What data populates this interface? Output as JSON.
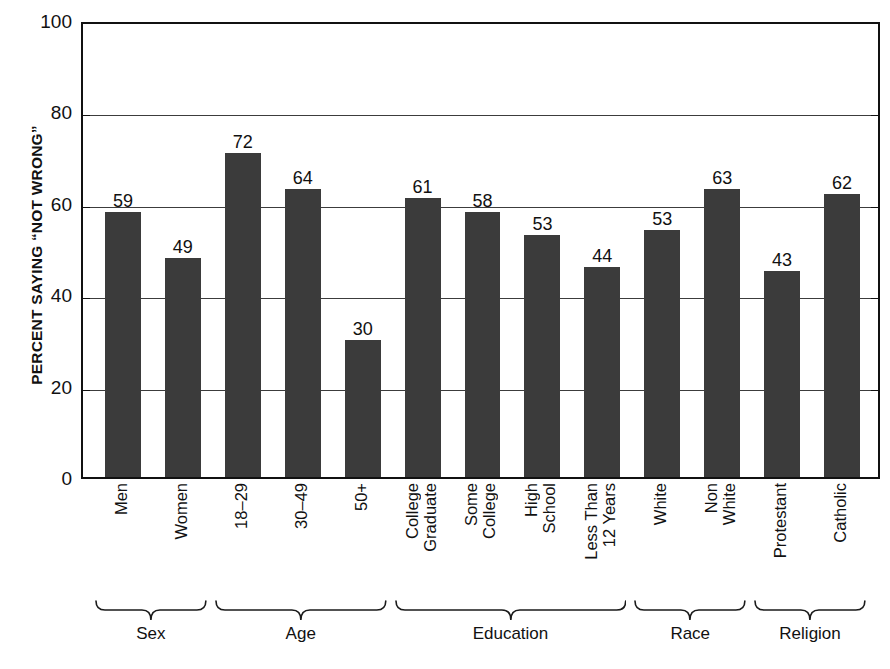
{
  "chart_data": {
    "type": "bar",
    "title": "",
    "subtitle": "",
    "xlabel": "",
    "ylabel": "PERCENT SAYING “NOT WRONG”",
    "ylim": [
      0,
      100
    ],
    "yticks": [
      0,
      20,
      40,
      60,
      80,
      100
    ],
    "ytick_labels": [
      "0",
      "20",
      "40",
      "60",
      "80",
      "100"
    ],
    "grid": true,
    "grid_axis": "y",
    "legend": false,
    "legend_position": "none",
    "bar_color": "#3b3b3b",
    "axis_color": "#111111",
    "background": "#ffffff",
    "value_labels": true,
    "categories": [
      "Men",
      "Women",
      "18–29",
      "30–49",
      "50+",
      "College Graduate",
      "Some College",
      "High School",
      "Less Than 12 Years",
      "White",
      "Non White",
      "Protestant",
      "Catholic"
    ],
    "category_lines": [
      [
        "Men"
      ],
      [
        "Women"
      ],
      [
        "18–29"
      ],
      [
        "30–49"
      ],
      [
        "50+"
      ],
      [
        "College",
        "Graduate"
      ],
      [
        "Some",
        "College"
      ],
      [
        "High",
        "School"
      ],
      [
        "Less Than",
        "12 Years"
      ],
      [
        "White"
      ],
      [
        "Non",
        "White"
      ],
      [
        "Protestant"
      ],
      [
        "Catholic"
      ]
    ],
    "values": [
      59,
      49,
      72,
      64,
      30,
      61,
      58,
      53,
      44,
      53,
      63,
      43,
      62
    ],
    "drawn_heights": [
      58,
      48,
      71,
      63,
      30,
      61,
      58,
      53,
      46,
      54,
      63,
      45,
      62
    ],
    "groups": [
      {
        "label": "Sex",
        "start": 0,
        "end": 1
      },
      {
        "label": "Age",
        "start": 2,
        "end": 4
      },
      {
        "label": "Education",
        "start": 5,
        "end": 8
      },
      {
        "label": "Race",
        "start": 9,
        "end": 10
      },
      {
        "label": "Religion",
        "start": 11,
        "end": 12
      }
    ]
  }
}
